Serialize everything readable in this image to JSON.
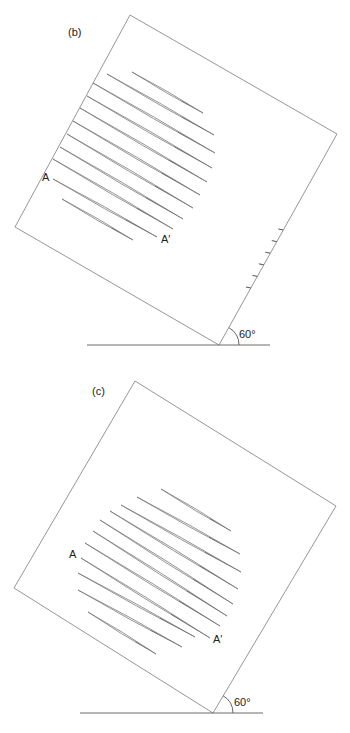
{
  "figures": [
    {
      "id": "b",
      "panel_label": "(b)",
      "label_a": "A",
      "label_a_prime": "A′",
      "angle_label": "60°",
      "angle_degrees": 60,
      "square": {
        "top": [
          130,
          15
        ],
        "right": [
          337,
          134
        ],
        "bottom": [
          219,
          345
        ],
        "left": [
          15,
          227
        ]
      },
      "baseline": {
        "x1": 87,
        "x2": 270,
        "y": 345
      },
      "tick_count": 6,
      "streak_count": 11,
      "streaks": [
        [
          [
            132,
            72
          ],
          [
            203,
            113
          ]
        ],
        [
          [
            107,
            74
          ],
          [
            214,
            135
          ]
        ],
        [
          [
            93,
            83
          ],
          [
            215,
            153
          ]
        ],
        [
          [
            87,
            96
          ],
          [
            212,
            168
          ]
        ],
        [
          [
            80,
            108
          ],
          [
            207,
            182
          ]
        ],
        [
          [
            73,
            121
          ],
          [
            200,
            195
          ]
        ],
        [
          [
            67,
            134
          ],
          [
            193,
            208
          ]
        ],
        [
          [
            60,
            147
          ],
          [
            183,
            219
          ]
        ],
        [
          [
            53,
            159
          ],
          [
            173,
            229
          ]
        ],
        [
          [
            53,
            179
          ],
          [
            157,
            237
          ]
        ],
        [
          [
            62,
            199
          ],
          [
            133,
            240
          ]
        ]
      ]
    },
    {
      "id": "c",
      "panel_label": "(c)",
      "label_a": "A",
      "label_a_prime": "A′",
      "angle_label": "60°",
      "angle_degrees": 60,
      "square": {
        "top": [
          135,
          381
        ],
        "right": [
          336,
          506
        ],
        "bottom": [
          213,
          713
        ],
        "left": [
          14,
          588
        ]
      },
      "baseline": {
        "x1": 80,
        "x2": 263,
        "y": 713
      },
      "tick_count": 0,
      "streak_count": 11,
      "streaks": [
        [
          [
            161,
            489
          ],
          [
            231,
            531
          ]
        ],
        [
          [
            137,
            497
          ],
          [
            240,
            554
          ]
        ],
        [
          [
            121,
            505
          ],
          [
            241,
            572
          ]
        ],
        [
          [
            110,
            511
          ],
          [
            238,
            589
          ]
        ],
        [
          [
            100,
            520
          ],
          [
            233,
            604
          ]
        ],
        [
          [
            93,
            531
          ],
          [
            227,
            616
          ]
        ],
        [
          [
            85,
            543
          ],
          [
            220,
            626
          ]
        ],
        [
          [
            81,
            558
          ],
          [
            210,
            638
          ]
        ],
        [
          [
            78,
            573
          ],
          [
            195,
            637
          ]
        ],
        [
          [
            78,
            590
          ],
          [
            182,
            647
          ]
        ],
        [
          [
            88,
            612
          ],
          [
            156,
            654
          ]
        ]
      ]
    }
  ]
}
